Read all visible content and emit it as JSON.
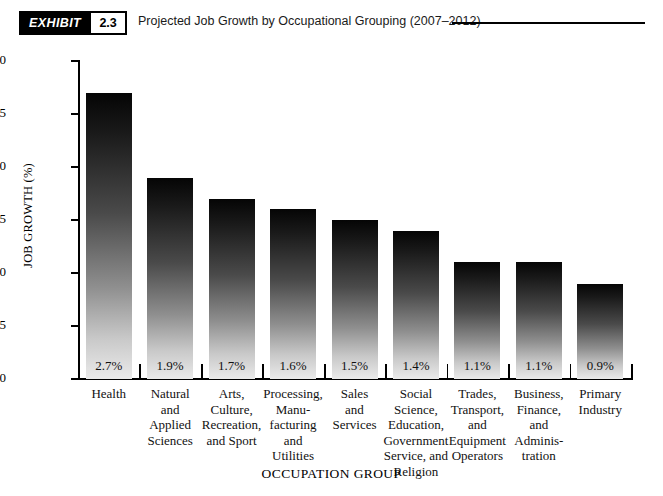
{
  "exhibit": {
    "badge_label": "EXHIBIT",
    "number": "2.3",
    "title": "Projected Job Growth by Occupational Grouping (2007–2012)"
  },
  "chart_data": {
    "type": "bar",
    "title": "Projected Job Growth by Occupational Grouping (2007–2012)",
    "xlabel": "OCCUPATION GROUP",
    "ylabel": "JOB GROWTH (%)",
    "ylim": [
      0.0,
      3.0
    ],
    "ytick_step": 0.5,
    "grid": false,
    "legend": null,
    "categories": [
      "Health",
      "Natural and Applied Sciences",
      "Arts, Culture, Recreation, and Sport",
      "Processing, Manu-facturing and Utilities",
      "Sales and Services",
      "Social Science, Education, Government Service, and Religion",
      "Trades, Transport, and Equipment Operators",
      "Business, Finance, and Adminis-tration",
      "Primary Industry"
    ],
    "category_lines": [
      [
        "Health"
      ],
      [
        "Natural",
        "and",
        "Applied",
        "Sciences"
      ],
      [
        "Arts,",
        "Culture,",
        "Recreation,",
        "and Sport"
      ],
      [
        "Processing,",
        "Manu-",
        "facturing",
        "and",
        "Utilities"
      ],
      [
        "Sales",
        "and",
        "Services"
      ],
      [
        "Social",
        "Science,",
        "Education,",
        "Government",
        "Service, and",
        "Religion"
      ],
      [
        "Trades,",
        "Transport,",
        "and",
        "Equipment",
        "Operators"
      ],
      [
        "Business,",
        "Finance,",
        "and",
        "Adminis-",
        "tration"
      ],
      [
        "Primary",
        "Industry"
      ]
    ],
    "values": [
      2.7,
      1.9,
      1.7,
      1.6,
      1.5,
      1.4,
      1.1,
      1.1,
      0.9
    ],
    "value_labels": [
      "2.7%",
      "1.9%",
      "1.7%",
      "1.6%",
      "1.5%",
      "1.4%",
      "1.1%",
      "1.1%",
      "0.9%"
    ],
    "ytick_labels": [
      "0.0",
      "0.5",
      "1.0",
      "1.5",
      "2.0",
      "2.5",
      "3.0"
    ],
    "ytick_values": [
      0.0,
      0.5,
      1.0,
      1.5,
      2.0,
      2.5,
      3.0
    ],
    "bar_gradient_top": "#050505",
    "bar_gradient_bottom": "#eaeaea",
    "axis_color": "#000000"
  }
}
